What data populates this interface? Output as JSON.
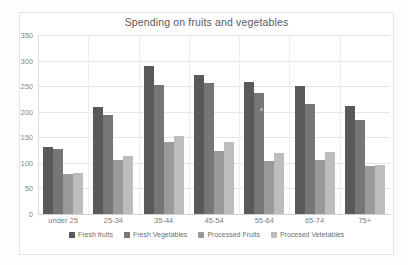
{
  "chart_data": {
    "type": "bar",
    "title": "Spending on fruits and vegetables",
    "xlabel": "",
    "ylabel": "",
    "ylim": [
      0,
      350
    ],
    "yticks": [
      0,
      50,
      100,
      150,
      200,
      250,
      300,
      350
    ],
    "grid": true,
    "legend_position": "bottom",
    "categories": [
      "under 25",
      "25-34",
      "35-44",
      "45-54",
      "55-64",
      "65-74",
      "75+"
    ],
    "series": [
      {
        "name": "Fresh fruits",
        "color": "#595959",
        "values": [
          131,
          209,
          289,
          271,
          259,
          251,
          212
        ]
      },
      {
        "name": "Fresh Vegetables",
        "color": "#767676",
        "values": [
          128,
          194,
          253,
          256,
          236,
          215,
          184
        ]
      },
      {
        "name": "Processed Fruits",
        "color": "#9a9a9a",
        "values": [
          78,
          106,
          141,
          124,
          103,
          106,
          94
        ]
      },
      {
        "name": "Procesed Vetetables",
        "color": "#bdbdbd",
        "values": [
          81,
          113,
          152,
          140,
          120,
          122,
          95
        ]
      }
    ]
  }
}
